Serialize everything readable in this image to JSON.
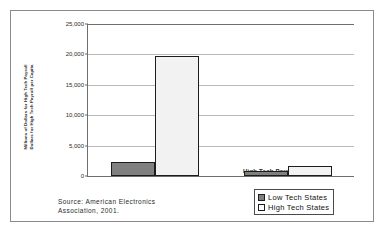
{
  "chart_data": {
    "type": "bar",
    "title": "",
    "xlabel": "",
    "ylabel_line1": "Millions of Dollars for High Tech Payroll",
    "ylabel_line2": "Dollars for High Tech Payroll per Capita",
    "categories": [
      "High Tech Payroll",
      "High Tech Payroll per capita"
    ],
    "series": [
      {
        "name": "Low Tech States",
        "values": [
          2350,
          800
        ],
        "color": "#808080"
      },
      {
        "name": "High Tech States",
        "values": [
          19800,
          1700
        ],
        "color": "#ffffff"
      }
    ],
    "ylim": [
      0,
      25000
    ],
    "ytick_values": [
      0,
      5000,
      10000,
      15000,
      20000,
      25000
    ],
    "ytick_labels": [
      "0",
      "5,000",
      "10,000",
      "15,000",
      "20,000",
      "25,000"
    ],
    "grid": true,
    "legend_position": "bottom-right",
    "annotations": [
      "Source: American Electronics Association, 2001."
    ]
  },
  "legend": {
    "items": [
      {
        "label": "Low Tech States",
        "swatch": "low"
      },
      {
        "label": "High Tech States",
        "swatch": "high"
      }
    ]
  },
  "source": {
    "line1": "Source: American Electronics",
    "line2": "Association, 2001."
  }
}
